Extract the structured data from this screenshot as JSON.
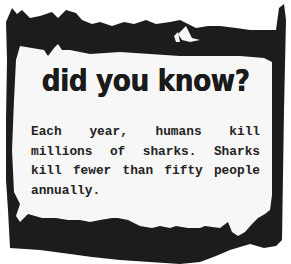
{
  "card": {
    "title": "did you know?",
    "body": "Each year, humans kill millions of sharks. Sharks kill fewer than fifty people annually.",
    "colors": {
      "frame": "#1c1c1c",
      "paper": "#f7f7f7",
      "background": "#ffffff",
      "text": "#222222"
    }
  }
}
